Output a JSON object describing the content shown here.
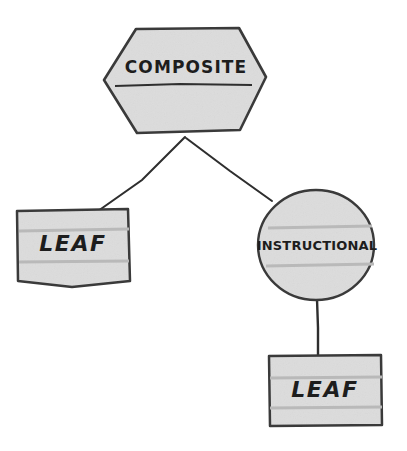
{
  "diagram": {
    "background_color": "#ffffff",
    "shape_fill_color": "#dcdcdc",
    "stroke_color": "#3a3a3a",
    "edge_color": "#2e2e2e",
    "rule_color": "#b9b9b9",
    "nodes": [
      {
        "id": "composite",
        "label": "COMPOSITE",
        "shape": "hexagon",
        "has_divider": true
      },
      {
        "id": "leaf-left",
        "label": "LEAF",
        "shape": "rectangle",
        "has_divider": false
      },
      {
        "id": "instructional",
        "label": "INSTRUCTIONAL",
        "shape": "circle",
        "has_divider": false
      },
      {
        "id": "leaf-bottom",
        "label": "LEAF",
        "shape": "rectangle",
        "has_divider": false
      }
    ],
    "edges": [
      {
        "id": "edge-composite-leaf-left",
        "from": "composite",
        "to": "leaf-left"
      },
      {
        "id": "edge-composite-instructional",
        "from": "composite",
        "to": "instructional"
      },
      {
        "id": "edge-instructional-leaf-bottom",
        "from": "instructional",
        "to": "leaf-bottom"
      }
    ]
  }
}
